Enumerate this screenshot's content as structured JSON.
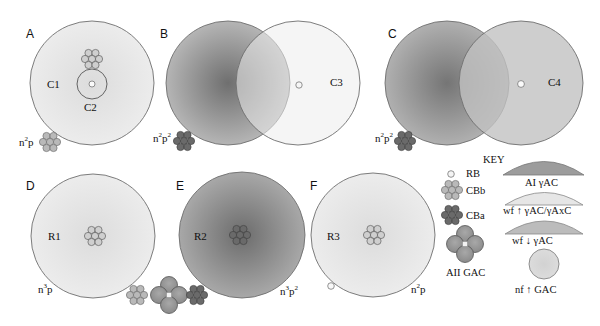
{
  "panels": {
    "A": {
      "label": "A",
      "regions": [
        "C1",
        "C2"
      ],
      "genotype": {
        "base": "n",
        "n_sup": "2",
        "p": "p",
        "p_sup": ""
      }
    },
    "B": {
      "label": "B",
      "regions": [
        "C3"
      ],
      "genotype": {
        "base": "n",
        "n_sup": "2",
        "p": "p",
        "p_sup": "2"
      }
    },
    "C": {
      "label": "C",
      "regions": [
        "C4"
      ],
      "genotype": {
        "base": "n",
        "n_sup": "2",
        "p": "p",
        "p_sup": "2"
      }
    },
    "D": {
      "label": "D",
      "regions": [
        "R1"
      ],
      "genotype": {
        "base": "n",
        "n_sup": "3",
        "p": "p",
        "p_sup": ""
      }
    },
    "E": {
      "label": "E",
      "regions": [
        "R2"
      ],
      "genotype": {
        "base": "n",
        "n_sup": "3",
        "p": "p",
        "p_sup": "2"
      }
    },
    "F": {
      "label": "F",
      "regions": [
        "R3"
      ],
      "genotype": {
        "base": "n",
        "n_sup": "2",
        "p": "p",
        "p_sup": ""
      }
    }
  },
  "key": {
    "title": "KEY",
    "items": [
      {
        "symbol": "rb-circle",
        "label": "RB"
      },
      {
        "symbol": "cbb-cluster",
        "label": "CBb"
      },
      {
        "symbol": "cba-cluster",
        "label": "CBa"
      },
      {
        "symbol": "aii-gac-cluster",
        "label": "AII GAC"
      }
    ],
    "fields": [
      {
        "symbol": "arc-dark",
        "label": "AI γAC"
      },
      {
        "symbol": "arc-light",
        "label": "wf ↑ γAC/γAxC"
      },
      {
        "symbol": "arc-medium",
        "label": "wf ↓ γAC"
      },
      {
        "symbol": "circle-field",
        "label": "nf ↑ GAC"
      }
    ]
  },
  "colors": {
    "outline": "#6e6e6e",
    "light_field": "#e6e6e6",
    "medium_field": "#b9b9b9",
    "dark_field": "#7a7a7a",
    "cbb_fill": "#b8b8b8",
    "cba_fill": "#6a6a6a",
    "gac_fill": "#9a9a9a"
  }
}
